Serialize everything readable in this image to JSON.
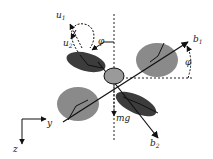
{
  "diagram": {
    "labels": {
      "u1": "u",
      "u1_sub": "1",
      "u2": "u",
      "u2_sub": "2",
      "phi_top": "φ",
      "phi_right": "φ",
      "b1": "b",
      "b1_sub": "1",
      "b2": "b",
      "b2_sub": "2",
      "mg": "mg",
      "y": "y",
      "z": "z"
    },
    "colors": {
      "dark_rotor": "#3c3c3c",
      "light_rotor": "#8a8a8a",
      "body": "#9a9a9a",
      "line": "#111111",
      "background": "#ffffff"
    }
  }
}
